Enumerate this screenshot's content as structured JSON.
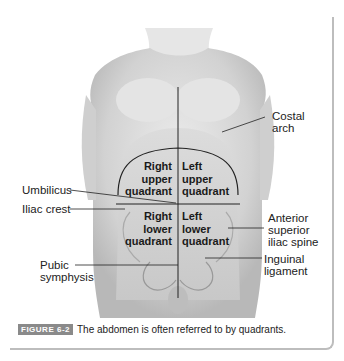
{
  "figure": {
    "labels": {
      "costal_arch": [
        "Costal",
        "arch"
      ],
      "umbilicus": "Umbilicus",
      "iliac_crest": "Iliac crest",
      "pubic_symphysis": [
        "Pubic",
        "symphysis"
      ],
      "asis": [
        "Anterior",
        "superior",
        "iliac spine"
      ],
      "inguinal_ligament": [
        "Inguinal",
        "ligament"
      ]
    },
    "quadrants": {
      "ruq": [
        "Right",
        "upper",
        "quadrant"
      ],
      "luq": [
        "Left",
        "upper",
        "quadrant"
      ],
      "rlq": [
        "Right",
        "lower",
        "quadrant"
      ],
      "llq": [
        "Left",
        "lower",
        "quadrant"
      ]
    }
  },
  "caption": {
    "badge": "FIGURE 6-2",
    "text": "The abdomen is often referred to by quadrants."
  }
}
